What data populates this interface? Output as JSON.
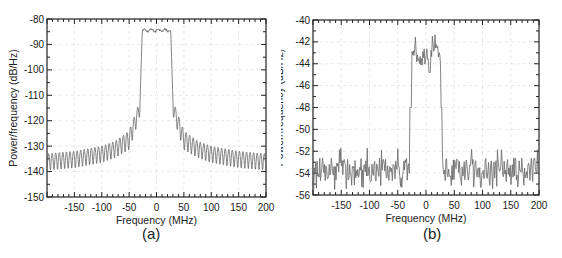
{
  "chart_data": [
    {
      "type": "line",
      "panel_label": "(a)",
      "title": "",
      "xlabel": "Frequency (MHz)",
      "ylabel": "Power/frequency (dB/Hz)",
      "xlim": [
        -200,
        200
      ],
      "ylim": [
        -150,
        -80
      ],
      "xticks": [
        -150,
        -100,
        -50,
        0,
        50,
        100,
        150,
        200
      ],
      "yticks": [
        -150,
        -140,
        -130,
        -120,
        -110,
        -100,
        -90,
        -80
      ],
      "grid": true,
      "legend": null,
      "description": "Spectrum with flat passband ~-84 to -85 dB/Hz between about -28 and +28 MHz, steep skirts, oscillating sidelobes decaying from ~-115 dB/Hz near ±33 MHz to ~-133..-140 dB/Hz at ±200 MHz",
      "passband": {
        "x_start": -28,
        "x_end": 28,
        "level": -84.5
      },
      "sidelobe_envelope": {
        "x": [
          30,
          35,
          50,
          75,
          100,
          150,
          200
        ],
        "upper": [
          -112,
          -115,
          -124,
          -128,
          -130,
          -132,
          -133
        ],
        "lower": [
          -118,
          -122,
          -132,
          -135,
          -137,
          -139,
          -140
        ]
      }
    },
    {
      "type": "line",
      "panel_label": "(b)",
      "title": "",
      "xlabel": "Frequency (MHz)",
      "ylabel": "Power/frequency (dB/Hz)",
      "xlim": [
        -200,
        200
      ],
      "ylim": [
        -56,
        -40
      ],
      "xticks": [
        -150,
        -100,
        -50,
        0,
        50,
        100,
        150,
        200
      ],
      "yticks": [
        -56,
        -54,
        -52,
        -50,
        -48,
        -46,
        -44,
        -42,
        -40
      ],
      "grid": true,
      "legend": null,
      "description": "Noisy measured spectrum: passband ~-42 to -44 dB/Hz between about -28 and +28 MHz, noise floor ~-53 to -55 dB/Hz elsewhere",
      "passband": {
        "x_start": -28,
        "x_end": 28,
        "level_range": [
          -45,
          -41.5
        ]
      },
      "noise_floor": {
        "level_range": [
          -55.5,
          -52
        ],
        "mean": -53.7
      }
    }
  ]
}
